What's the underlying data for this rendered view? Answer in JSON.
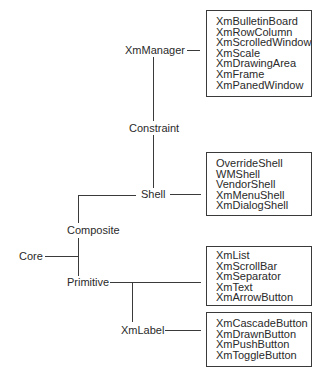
{
  "nodes": {
    "xmmanager": "XmManager",
    "constraint": "Constraint",
    "shell": "Shell",
    "composite": "Composite",
    "core": "Core",
    "primitive": "Primitive",
    "xmlabel": "XmLabel"
  },
  "boxes": {
    "manager_widgets": [
      "XmBulletinBoard",
      "XmRowColumn",
      "XmScrolledWindow",
      "XmScale",
      "XmDrawingArea",
      "XmFrame",
      "XmPanedWindow"
    ],
    "shell_widgets": [
      "OverrideShell",
      "WMShell",
      "VendorShell",
      "XmMenuShell",
      "XmDialogShell"
    ],
    "primitive_widgets": [
      "XmList",
      "XmScrollBar",
      "XmSeparator",
      "XmText",
      "XmArrowButton"
    ],
    "label_widgets": [
      "XmCascadeButton",
      "XmDrawnButton",
      "XmPushButton",
      "XmToggleButton"
    ]
  }
}
